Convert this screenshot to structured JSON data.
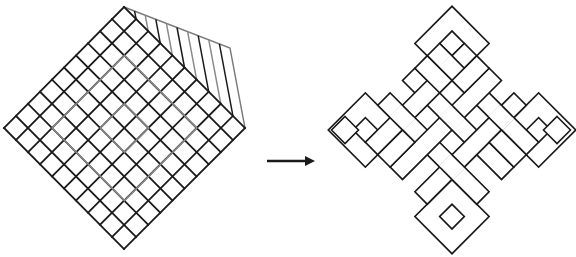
{
  "figure": {
    "left_panel": {
      "label": "rotated-grid-cube",
      "grid_cells": 10,
      "hatch_lines": 9,
      "corners": {
        "top": [
          124,
          7
        ],
        "right": [
          245,
          128
        ],
        "bottom": [
          124,
          249
        ],
        "left": [
          4,
          128
        ]
      },
      "side_face": {
        "top_left": [
          124,
          7
        ],
        "top_right": [
          230,
          48
        ],
        "bottom_right": [
          245,
          128
        ]
      }
    },
    "arrow": {
      "from": [
        267,
        161
      ],
      "to": [
        315,
        161
      ],
      "direction": "right"
    },
    "right_panel": {
      "label": "endless-knot",
      "center": [
        452,
        130
      ],
      "unit": 17.5,
      "small_diamonds": [
        {
          "name": "left-diamond",
          "center": [
            345,
            130
          ],
          "half": 13.5
        },
        {
          "name": "right-diamond",
          "center": [
            557,
            130
          ],
          "half": 13.5
        }
      ]
    },
    "colors": {
      "line": "#1a1a1a",
      "light_line": "#8a8a8a",
      "background": "#ffffff"
    }
  }
}
